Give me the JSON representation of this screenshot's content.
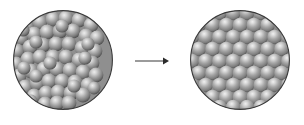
{
  "figure": {
    "title": "Disorder-to-order transition of packed spheres",
    "background_color": "#ffffff",
    "width": 304,
    "height": 125
  },
  "palette": {
    "sphere_highlight": "#e6e6e6",
    "sphere_midtone": "#9a9a9a",
    "sphere_body": "#8c8c8c",
    "sphere_shadow": "#4d4d4d",
    "circle_outline": "#3b3b3b",
    "circle_fill": "#8f8f8f",
    "arrow_color": "#8a8a8a",
    "arrow_head_color": "#2b2b2b",
    "background": "#ffffff"
  },
  "panels": [
    {
      "id": "left-panel",
      "name": "disordered-sphere-packing",
      "label": "",
      "state": "disordered",
      "center_x": 63,
      "center_y": 60,
      "radius": 50,
      "sphere_radius": 7.2,
      "sphere_count": 57,
      "packing": "random",
      "spheres": [
        [
          27,
          26
        ],
        [
          40,
          22
        ],
        [
          53,
          19
        ],
        [
          66,
          18
        ],
        [
          79,
          20
        ],
        [
          91,
          25
        ],
        [
          21,
          38
        ],
        [
          34,
          34
        ],
        [
          47,
          32
        ],
        [
          60,
          31
        ],
        [
          73,
          31
        ],
        [
          86,
          36
        ],
        [
          97,
          38
        ],
        [
          17,
          51
        ],
        [
          30,
          47
        ],
        [
          43,
          45
        ],
        [
          56,
          44
        ],
        [
          69,
          44
        ],
        [
          82,
          48
        ],
        [
          95,
          51
        ],
        [
          16,
          64
        ],
        [
          28,
          59
        ],
        [
          40,
          57
        ],
        [
          53,
          57
        ],
        [
          66,
          57
        ],
        [
          79,
          60
        ],
        [
          92,
          63
        ],
        [
          19,
          76
        ],
        [
          31,
          71
        ],
        [
          44,
          69
        ],
        [
          57,
          69
        ],
        [
          70,
          70
        ],
        [
          83,
          72
        ],
        [
          96,
          75
        ],
        [
          25,
          87
        ],
        [
          37,
          83
        ],
        [
          49,
          81
        ],
        [
          62,
          81
        ],
        [
          75,
          82
        ],
        [
          88,
          85
        ],
        [
          34,
          96
        ],
        [
          46,
          93
        ],
        [
          58,
          92
        ],
        [
          71,
          93
        ],
        [
          83,
          95
        ],
        [
          45,
          104
        ],
        [
          57,
          103
        ],
        [
          69,
          103
        ],
        [
          23,
          30
        ],
        [
          36,
          42
        ],
        [
          62,
          26
        ],
        [
          88,
          44
        ],
        [
          24,
          68
        ],
        [
          74,
          86
        ],
        [
          50,
          63
        ],
        [
          36,
          76
        ],
        [
          85,
          58
        ]
      ]
    },
    {
      "id": "right-panel",
      "name": "ordered-sphere-packing",
      "label": "",
      "state": "ordered",
      "center_x": 240,
      "center_y": 60,
      "radius": 50,
      "sphere_radius": 7.2,
      "packing": "hexagonal-close-packed",
      "row_pitch": 12.0,
      "column_pitch": 13.8,
      "row_offset": 6.9,
      "rows": 9,
      "columns": 8
    }
  ],
  "arrow": {
    "name": "transition-arrow",
    "direction": "right",
    "x_start": 135,
    "x_end": 168,
    "y": 61,
    "line_width": 1.6,
    "head_width": 6,
    "head_height": 6,
    "label": ""
  }
}
